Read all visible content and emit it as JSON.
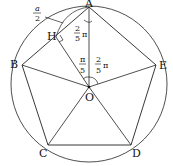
{
  "diagram": {
    "type": "regular-pentagon-inscribed-in-circle",
    "colors": {
      "stroke": "#222222",
      "background": "#ffffff"
    },
    "circle": {
      "cx": 89,
      "cy": 84,
      "r": 78
    },
    "vertices": {
      "A": {
        "x": 89,
        "y": 7,
        "label": "A"
      },
      "B": {
        "x": 22,
        "y": 65,
        "label": "B"
      },
      "C": {
        "x": 48,
        "y": 145,
        "label": "C"
      },
      "D": {
        "x": 131,
        "y": 145,
        "label": "D"
      },
      "E": {
        "x": 156,
        "y": 65,
        "label": "E"
      }
    },
    "center": {
      "x": 89,
      "y": 87,
      "label": "O"
    },
    "foot": {
      "x": 58,
      "y": 39,
      "label": "H"
    },
    "annotations": {
      "half_side": {
        "num": "a",
        "den": "2"
      },
      "angle_HAO": {
        "num": "2",
        "den": "5",
        "suffix": "π"
      },
      "angle_AOH": {
        "num": "π",
        "den": "5"
      },
      "angle_AOE": {
        "num": "2",
        "den": "5",
        "suffix": "π"
      }
    }
  }
}
